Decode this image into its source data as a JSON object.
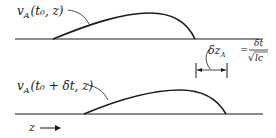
{
  "diagram": {
    "top": {
      "label_main": "v",
      "label_sub": "A",
      "label_args": "(t₀, z)"
    },
    "bottom": {
      "label_main": "v",
      "label_sub": "A",
      "label_args": "(t₀ + δt, z)"
    },
    "displacement": {
      "lhs_main": "δz",
      "lhs_sub": "A",
      "equals": "=",
      "numerator": "δt",
      "denominator": "lc",
      "sqrt_symbol": "√"
    },
    "axis": {
      "label": "z",
      "arrow": "→"
    },
    "colors": {
      "ink": "#1a1a1a",
      "background": "#ffffff"
    }
  }
}
